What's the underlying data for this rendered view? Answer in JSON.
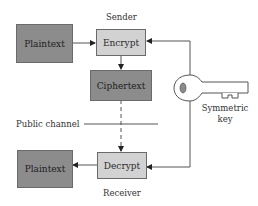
{
  "diagram": {
    "type": "symmetric-encryption-flow",
    "labels": {
      "sender": "Sender",
      "receiver": "Receiver",
      "public_channel": "Public channel",
      "key_line1": "Symmetric",
      "key_line2": "key"
    },
    "nodes": {
      "plaintext_top": "Plaintext",
      "encrypt": "Encrypt",
      "ciphertext": "Ciphertext",
      "decrypt": "Decrypt",
      "plaintext_bottom": "Plaintext"
    },
    "colors": {
      "dark_box": "#8c8c8c",
      "light_box": "#d2d2d2",
      "line": "#555555"
    },
    "edges": [
      {
        "from": "plaintext_top",
        "to": "encrypt",
        "style": "solid"
      },
      {
        "from": "encrypt",
        "to": "ciphertext",
        "style": "solid"
      },
      {
        "from": "ciphertext",
        "to": "decrypt",
        "style": "dashed"
      },
      {
        "from": "decrypt",
        "to": "plaintext_bottom",
        "style": "solid"
      },
      {
        "from": "symmetric_key",
        "to": "encrypt",
        "style": "solid"
      },
      {
        "from": "symmetric_key",
        "to": "decrypt",
        "style": "solid"
      }
    ]
  }
}
